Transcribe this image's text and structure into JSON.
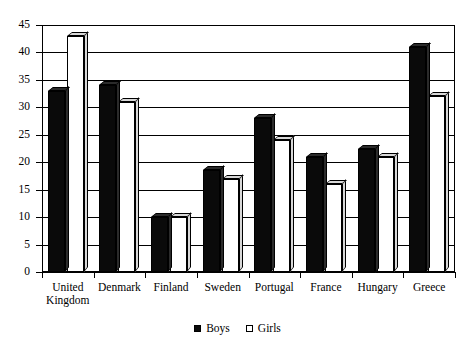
{
  "chart_data": {
    "type": "bar",
    "title": "",
    "xlabel": "",
    "ylabel": "",
    "ylim": [
      0,
      45
    ],
    "yticks": [
      0,
      5,
      10,
      15,
      20,
      25,
      30,
      35,
      40,
      45
    ],
    "grid": true,
    "legend_position": "bottom-center",
    "categories": [
      "United\nKingdom",
      "Denmark",
      "Finland",
      "Sweden",
      "Portugal",
      "France",
      "Hungary",
      "Greece"
    ],
    "series": [
      {
        "name": "Boys",
        "color": "#0a0a0a",
        "values": [
          33,
          34,
          10,
          18.5,
          28,
          21,
          22.5,
          41
        ]
      },
      {
        "name": "Girls",
        "color": "#ffffff",
        "values": [
          43,
          31,
          10,
          17,
          24,
          16,
          21,
          32
        ]
      }
    ]
  },
  "legend": {
    "items": [
      {
        "label": "Boys",
        "swatch": "filled-square-icon"
      },
      {
        "label": "Girls",
        "swatch": "open-square-icon"
      }
    ]
  }
}
